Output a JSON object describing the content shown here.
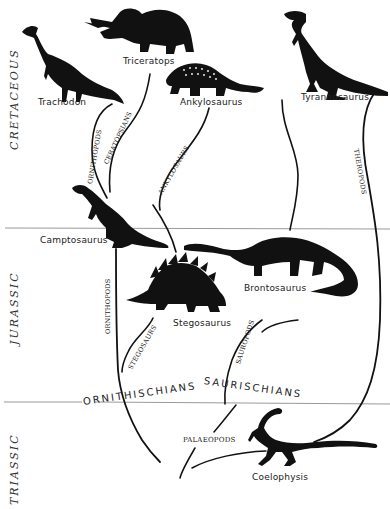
{
  "periods": [
    {
      "name": "CRETACEOUS"
    },
    {
      "name": "JURASSIC"
    },
    {
      "name": "TRIASSIC"
    }
  ],
  "species": {
    "trachodon": "Trachodon",
    "triceratops": "Triceratops",
    "ankylosaurus": "Ankylosaurus",
    "tyrannosaurus": "Tyrannosaurus",
    "camptosaurus": "Camptosaurus",
    "brontosaurus": "Brontosaurus",
    "stegosaurus": "Stegosaurus",
    "coelophysis": "Coelophysis"
  },
  "groups": {
    "ornithischians": "ORNITHISCHIANS",
    "saurischians": "SAURISCHIANS"
  },
  "branches": {
    "ornithopods_upper": "ORNITHOPODS",
    "ceratopsians": "CERATOPSIANS",
    "ankylosaurs": "ANKYLOSAURS",
    "theropods": "THEROPODS",
    "ornithopods_lower": "ORNITHOPODS",
    "stegosaurs": "STEGOSAURS",
    "sauropods": "SAUROPODS",
    "palaeopods": "PALAEOPODS"
  },
  "colors": {
    "silhouette": "#111111",
    "divider": "#888888",
    "background": "#ffffff"
  }
}
